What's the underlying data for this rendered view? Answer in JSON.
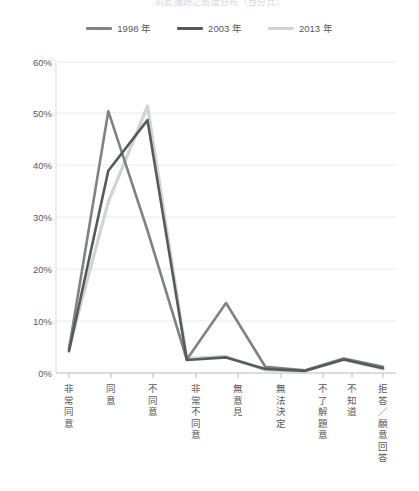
{
  "title": "對此議題之態度分布（百分比）",
  "legend": {
    "position": "top-center",
    "items": [
      {
        "label": "1998 年",
        "color": "#808285"
      },
      {
        "label": "2003 年",
        "color": "#58595b"
      },
      {
        "label": "2013 年",
        "color": "#d1d3d4"
      }
    ]
  },
  "yaxis": {
    "ticks": [
      "60%",
      "50%",
      "40%",
      "30%",
      "20%",
      "10%",
      "0%"
    ]
  },
  "xaxis": {
    "categories": [
      "非常同意",
      "同意",
      "不同意",
      "非常不同意",
      "無意見",
      "無法決定",
      "不了解題意",
      "不知道",
      "拒答／願意回答"
    ]
  },
  "chart_data": {
    "type": "line",
    "title": "對此議題之態度分布（百分比）",
    "xlabel": "",
    "ylabel": "",
    "ylim": [
      0,
      60
    ],
    "yticks": [
      0,
      10,
      20,
      30,
      40,
      50,
      60
    ],
    "ytick_labels": [
      "0%",
      "10%",
      "20%",
      "30%",
      "40%",
      "50%",
      "60%"
    ],
    "grid": true,
    "grid_axis": "y",
    "legend_position": "top-center",
    "categories": [
      "非常同意",
      "同意",
      "不同意",
      "非常不同意",
      "無意見",
      "無法決定",
      "不了解題意",
      "不知道",
      "拒答／願意回答"
    ],
    "series": [
      {
        "name": "1998 年",
        "color": "#808285",
        "values": [
          4.6,
          50.5,
          27.5,
          2.6,
          13.5,
          1.2,
          0.5,
          2.8,
          1.2
        ]
      },
      {
        "name": "2003 年",
        "color": "#58595b",
        "values": [
          4.2,
          39.0,
          48.8,
          2.5,
          3.0,
          0.8,
          0.4,
          2.6,
          0.9
        ]
      },
      {
        "name": "2013 年",
        "color": "#d1d3d4",
        "values": [
          4.8,
          33.0,
          51.5,
          2.8,
          3.2,
          0.6,
          0.4,
          2.6,
          0.8
        ]
      }
    ]
  }
}
